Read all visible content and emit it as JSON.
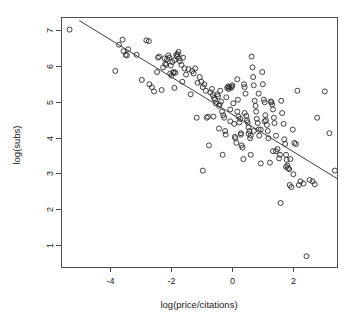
{
  "chart_data": {
    "type": "scatter",
    "title": "",
    "xlabel": "log(price/citations)",
    "ylabel": "log(subs)",
    "xlim": [
      -5.6,
      3.45
    ],
    "ylim": [
      0.4,
      7.35
    ],
    "xticks": [
      -4,
      -2,
      0,
      2
    ],
    "xtick_labels": [
      "-4",
      "-2",
      "0",
      "2"
    ],
    "yticks": [
      1,
      2,
      3,
      4,
      5,
      6,
      7
    ],
    "ytick_labels": [
      "1",
      "2",
      "3",
      "4",
      "5",
      "6",
      "7"
    ],
    "grid": false,
    "legend": "none",
    "marker": "open-circle",
    "marker_color": "#2b2b2b",
    "marker_radius": 2.5,
    "frame_color": "#4d4d4d",
    "fit_line": {
      "type": "linear-regression",
      "color": "#3d3d3d",
      "x": [
        -5.0,
        3.45
      ],
      "y": [
        7.25,
        2.86
      ]
    },
    "x": [
      -5.32,
      -3.82,
      -3.7,
      -3.58,
      -3.55,
      -3.48,
      -3.44,
      -3.4,
      -3.12,
      -2.95,
      -2.8,
      -2.72,
      -2.7,
      -2.62,
      -2.55,
      -2.45,
      -2.42,
      -2.38,
      -2.3,
      -2.25,
      -2.2,
      -2.18,
      -2.12,
      -2.08,
      -2.05,
      -2.02,
      -2.0,
      -1.98,
      -1.95,
      -1.92,
      -1.9,
      -1.88,
      -1.85,
      -1.82,
      -1.8,
      -1.78,
      -1.75,
      -1.72,
      -1.7,
      -1.65,
      -1.6,
      -1.55,
      -1.5,
      -1.42,
      -1.35,
      -1.3,
      -1.25,
      -1.2,
      -1.12,
      -1.05,
      -1.0,
      -0.95,
      -0.9,
      -0.85,
      -0.82,
      -0.78,
      -0.75,
      -0.7,
      -0.65,
      -0.62,
      -0.58,
      -0.55,
      -0.52,
      -0.48,
      -0.45,
      -0.42,
      -0.4,
      -0.38,
      -0.35,
      -0.32,
      -0.3,
      -0.28,
      -0.25,
      -0.22,
      -0.2,
      -0.18,
      -0.15,
      -0.12,
      -0.1,
      -0.08,
      -0.05,
      -0.02,
      0.0,
      0.02,
      0.05,
      0.08,
      0.1,
      0.12,
      0.15,
      0.18,
      0.2,
      0.22,
      0.25,
      0.28,
      0.3,
      0.32,
      0.35,
      0.38,
      0.4,
      0.42,
      0.45,
      0.48,
      0.5,
      0.52,
      0.55,
      0.58,
      0.6,
      0.62,
      0.65,
      0.68,
      0.7,
      0.72,
      0.75,
      0.78,
      0.8,
      0.82,
      0.85,
      0.88,
      0.9,
      0.95,
      1.0,
      1.02,
      1.05,
      1.08,
      1.1,
      1.12,
      1.15,
      1.18,
      1.2,
      1.25,
      1.28,
      1.3,
      1.32,
      1.35,
      1.38,
      1.4,
      1.45,
      1.5,
      1.55,
      1.58,
      1.6,
      1.65,
      1.7,
      1.72,
      1.75,
      1.78,
      1.8,
      1.82,
      1.85,
      1.88,
      1.9,
      1.95,
      2.0,
      2.05,
      2.1,
      2.15,
      2.2,
      2.25,
      2.35,
      2.45,
      2.55,
      2.65,
      2.72,
      2.8,
      3.05,
      3.2,
      3.38,
      0.95,
      0.3,
      -0.6,
      -1.15,
      0.55,
      1.45,
      1.92,
      0.18,
      -0.05,
      0.72,
      1.35,
      2.02,
      -2.15,
      -1.88,
      -0.42,
      0.88,
      1.62,
      -0.95,
      0.42,
      1.08,
      -1.62,
      0.62,
      1.78
    ],
    "y": [
      7.0,
      5.85,
      6.58,
      6.72,
      6.4,
      6.3,
      6.28,
      6.45,
      6.3,
      5.6,
      6.7,
      6.68,
      5.48,
      5.4,
      5.28,
      5.82,
      6.22,
      6.25,
      5.32,
      5.95,
      6.2,
      6.05,
      6.18,
      6.28,
      6.22,
      5.78,
      6.0,
      5.72,
      6.1,
      5.8,
      5.82,
      6.15,
      5.8,
      6.3,
      6.25,
      6.32,
      6.38,
      6.2,
      6.12,
      6.02,
      6.22,
      5.92,
      5.75,
      5.9,
      5.2,
      5.85,
      5.78,
      5.92,
      5.52,
      5.68,
      5.55,
      5.4,
      5.48,
      5.3,
      4.55,
      4.58,
      3.78,
      5.25,
      5.35,
      5.18,
      5.1,
      5.05,
      4.95,
      5.2,
      5.15,
      4.88,
      4.92,
      5.3,
      5.0,
      4.72,
      3.52,
      4.62,
      4.55,
      4.18,
      4.08,
      5.12,
      5.38,
      5.42,
      5.35,
      5.4,
      4.45,
      5.38,
      5.42,
      5.45,
      4.95,
      4.38,
      4.02,
      3.98,
      3.85,
      5.62,
      5.05,
      4.58,
      4.42,
      4.52,
      4.12,
      3.78,
      3.72,
      3.4,
      5.48,
      5.4,
      5.22,
      4.6,
      4.48,
      4.42,
      4.28,
      4.18,
      3.98,
      3.52,
      6.25,
      5.95,
      5.68,
      5.45,
      5.02,
      4.88,
      4.72,
      4.52,
      4.4,
      4.22,
      4.05,
      3.28,
      5.82,
      5.48,
      5.05,
      4.98,
      4.62,
      4.48,
      4.35,
      4.18,
      3.98,
      3.3,
      5.0,
      4.98,
      4.92,
      4.78,
      4.55,
      4.4,
      4.05,
      3.68,
      3.42,
      3.52,
      2.18,
      4.68,
      4.38,
      3.95,
      3.82,
      3.52,
      3.38,
      3.22,
      3.15,
      3.12,
      2.68,
      2.62,
      4.22,
      3.85,
      3.82,
      5.3,
      2.68,
      2.78,
      2.72,
      0.7,
      2.82,
      2.78,
      2.7,
      4.55,
      5.28,
      4.12,
      3.08,
      4.22,
      4.08,
      4.58,
      4.55,
      4.1,
      3.62,
      3.4,
      4.72,
      4.78,
      4.18,
      3.62,
      2.98,
      6.02,
      5.38,
      4.25,
      5.22,
      5.02,
      3.08,
      4.68,
      4.45,
      5.55,
      4.05,
      3.18
    ]
  },
  "geometry": {
    "plot_left": 61,
    "plot_right": 337,
    "plot_top": 17,
    "plot_bottom": 267
  }
}
